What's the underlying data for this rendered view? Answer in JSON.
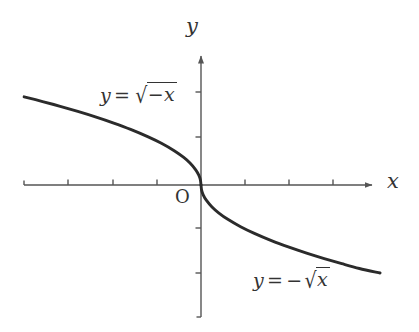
{
  "figure": {
    "background_color": "#ffffff",
    "axis_color": "#555555",
    "curve_color": "#2b2b2b",
    "text_color": "#333333",
    "axis_labels": {
      "x": "x",
      "y": "y"
    },
    "origin_label": "O",
    "curve_labels": {
      "left": {
        "lhs": "y",
        "equals": "=",
        "radical_sign": "√",
        "radicand_sign": "−",
        "radicand_var": "x",
        "plain": "y = √(−x)"
      },
      "right": {
        "lhs": "y",
        "equals": "=",
        "minus": "−",
        "radical_sign": "√",
        "radicand_var": "x",
        "plain": "y = −√x"
      }
    }
  },
  "chart_data": {
    "type": "line",
    "title": "",
    "xlabel": "x",
    "ylabel": "y",
    "grid": false,
    "legend": "none",
    "origin_pixel": [
      201,
      185
    ],
    "unit_pixels": 44,
    "xlim": [
      -4.02,
      4.02
    ],
    "ylim": [
      -3.0,
      3.07
    ],
    "x_tick_pixels": [
      68,
      113,
      157,
      245,
      289,
      333
    ],
    "y_tick_pixels": [
      92,
      137,
      228,
      273
    ],
    "x_ticks": [
      -3,
      -2,
      -1,
      1,
      2,
      3
    ],
    "y_ticks": [
      2,
      1,
      -1,
      -2
    ],
    "tick_labels_shown": false,
    "axis_extent_pixels": {
      "x_start": 24,
      "x_arrow_end": 378,
      "y_bottom": 317,
      "y_arrow_end": 50
    },
    "series": [
      {
        "name": "y = √(−x)",
        "domain": [
          -4.02,
          0
        ],
        "points": [
          [
            -4.02,
            2.005
          ],
          [
            -3.6,
            1.897
          ],
          [
            -3.2,
            1.789
          ],
          [
            -2.8,
            1.673
          ],
          [
            -2.4,
            1.549
          ],
          [
            -2.0,
            1.414
          ],
          [
            -1.6,
            1.265
          ],
          [
            -1.2,
            1.095
          ],
          [
            -0.9,
            0.949
          ],
          [
            -0.6,
            0.775
          ],
          [
            -0.4,
            0.632
          ],
          [
            -0.25,
            0.5
          ],
          [
            -0.12,
            0.346
          ],
          [
            -0.05,
            0.224
          ],
          [
            -0.015,
            0.122
          ],
          [
            0,
            0
          ]
        ]
      },
      {
        "name": "y = −√x",
        "domain": [
          0,
          4.07
        ],
        "points": [
          [
            0,
            0
          ],
          [
            0.015,
            -0.122
          ],
          [
            0.05,
            -0.224
          ],
          [
            0.12,
            -0.346
          ],
          [
            0.25,
            -0.5
          ],
          [
            0.4,
            -0.632
          ],
          [
            0.6,
            -0.775
          ],
          [
            0.9,
            -0.949
          ],
          [
            1.2,
            -1.095
          ],
          [
            1.6,
            -1.265
          ],
          [
            2.0,
            -1.414
          ],
          [
            2.4,
            -1.549
          ],
          [
            2.8,
            -1.673
          ],
          [
            3.2,
            -1.789
          ],
          [
            3.6,
            -1.897
          ],
          [
            4.07,
            -2.0
          ]
        ]
      }
    ],
    "annotations": [
      {
        "text": "y = √(−x)",
        "pixel": [
          100,
          83
        ]
      },
      {
        "text": "y = −√x",
        "pixel": [
          253,
          268
        ]
      },
      {
        "text": "O",
        "pixel": [
          175,
          186
        ]
      }
    ]
  }
}
